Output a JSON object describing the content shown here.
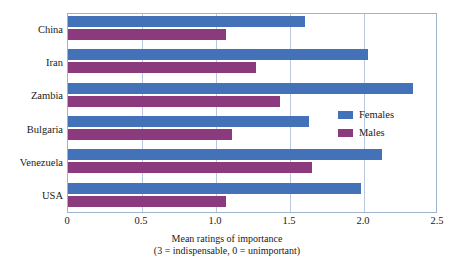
{
  "chart_data": {
    "type": "bar",
    "orientation": "horizontal",
    "title": "",
    "xlabel": "Mean ratings of importance",
    "xlabel_line2": "(3 = indispensable, 0 = unimportant)",
    "ylabel": "",
    "categories": [
      "China",
      "Iran",
      "Zambia",
      "Bulgaria",
      "Venezuela",
      "USA"
    ],
    "series": [
      {
        "name": "Females",
        "color": "#4472b8",
        "values": [
          1.6,
          2.03,
          2.33,
          1.63,
          2.12,
          1.98
        ]
      },
      {
        "name": "Males",
        "color": "#8b3a7e",
        "values": [
          1.07,
          1.27,
          1.43,
          1.11,
          1.65,
          1.07
        ]
      }
    ],
    "xlim": [
      0,
      2.5
    ],
    "xticks": [
      0,
      0.5,
      1.0,
      1.5,
      2.0,
      2.5
    ],
    "xtick_labels": [
      "0",
      "0.5",
      "1.0",
      "1.5",
      "2.0",
      "2.5"
    ],
    "grid": true,
    "grid_axis": "x",
    "legend": [
      "Females",
      "Males"
    ],
    "legend_position": "right"
  },
  "legend": {
    "females_label": "Females",
    "males_label": "Males"
  },
  "axis": {
    "title_line1": "Mean ratings of importance",
    "title_line2": "(3 = indispensable, 0 = unimportant)"
  }
}
